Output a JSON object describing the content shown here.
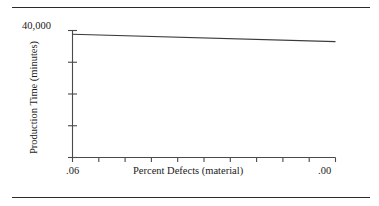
{
  "figure": {
    "background_color": "#ffffff",
    "line_color": "#3a3a3a",
    "axis_color": "#4a4a4a",
    "rule_color": "#2a2a2a",
    "top_rule_label": "",
    "bottom_rule_label": ""
  },
  "chart_data": {
    "type": "line",
    "title": "",
    "subtitle": "",
    "xlabel": "Percent Defects (material)",
    "ylabel": "Production Time (minutes)",
    "x": [
      0.06,
      0.0
    ],
    "values": [
      38800,
      36500
    ],
    "series": [
      {
        "name": "Production Time",
        "x": [
          0.06,
          0.0
        ],
        "values": [
          38800,
          36500
        ]
      }
    ],
    "xlim": [
      0.06,
      0.0
    ],
    "ylim": [
      0,
      40000
    ],
    "x_tick_labels": [
      ".06",
      "",
      "",
      "",
      "",
      "",
      "",
      "",
      "",
      "",
      ".00"
    ],
    "x_tick_values": [
      0.06,
      0.054,
      0.048,
      0.042,
      0.036,
      0.03,
      0.024,
      0.018,
      0.012,
      0.006,
      0.0
    ],
    "x_tick_count": 11,
    "y_tick_labels": [
      "40,000",
      "",
      "",
      "",
      ""
    ],
    "y_tick_values": [
      40000,
      30000,
      20000,
      10000,
      0
    ],
    "y_tick_count": 5,
    "y_axis_top_label": "40,000",
    "x_axis_left_label": ".06",
    "x_axis_right_label": ".00",
    "grid": false,
    "legend": false,
    "legend_position": "none",
    "annotations": []
  },
  "axes": {
    "y_top_label": "40,000",
    "x_left_label": ".06",
    "x_right_label": ".00",
    "x_title": "Percent Defects (material)",
    "y_title": "Production Time (minutes)"
  }
}
